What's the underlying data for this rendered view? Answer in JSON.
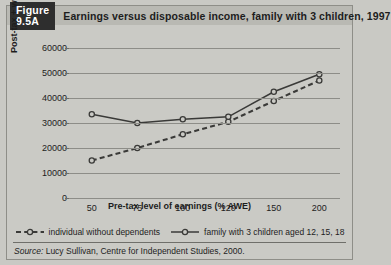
{
  "figure": {
    "tag": "Figure 9.5A",
    "title": "Earnings versus disposable income, family with 3 children, 1997",
    "source_prefix": "Source:",
    "source_text": " Lucy Sullivan, Centre for Independent Studies, 2000."
  },
  "colors": {
    "panel_bg": "#cacac5",
    "header_bg": "#b9b9b3",
    "tag_bg": "#2e2e2e",
    "tag_text": "#ffffff",
    "grid": "#8d8d88",
    "ink": "#1d1d1d",
    "series_line": "#3a3a38",
    "marker_fill": "#cacac5"
  },
  "chart_data": {
    "type": "line",
    "title": "Earnings versus disposable income, family with 3 children, 1997",
    "xlabel": "Pre-tax level of earnings (% AWE)",
    "ylabel": "Post-tax + welfare annual income -$s",
    "categories": [
      "50",
      "75",
      "100",
      "120",
      "150",
      "200"
    ],
    "x_ticks": [
      "50",
      "75",
      "100",
      "120",
      "150",
      "200"
    ],
    "y_ticks": [
      "0",
      "10000",
      "20000",
      "30000",
      "40000",
      "50000",
      "60000"
    ],
    "ylim": [
      0,
      60000
    ],
    "grid": true,
    "legend_position": "bottom",
    "series": [
      {
        "name": "individual without dependents",
        "style": "dashed",
        "marker": "circle",
        "values": [
          15000,
          20000,
          25500,
          30500,
          38800,
          47000
        ]
      },
      {
        "name": "family with 3 children aged 12, 15, 18",
        "style": "solid",
        "marker": "circle",
        "values": [
          33500,
          30000,
          31500,
          32500,
          42500,
          49500
        ]
      }
    ]
  }
}
